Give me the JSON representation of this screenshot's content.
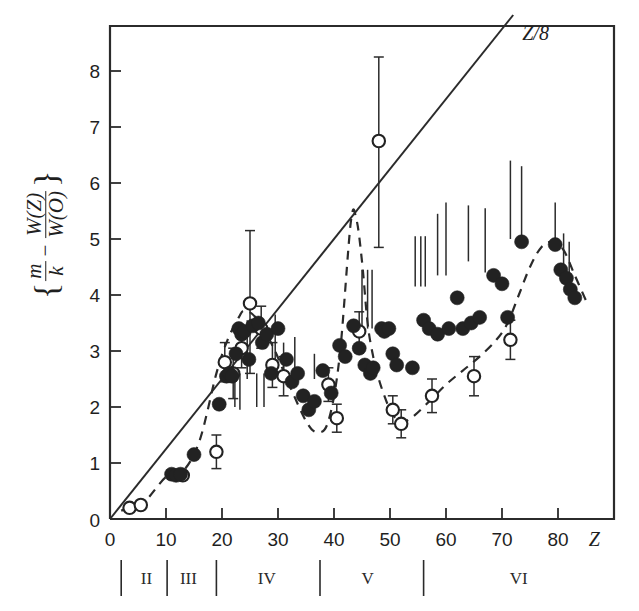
{
  "figure": {
    "title": "",
    "y_axis_label_parts": {
      "open_brace": "{",
      "frac1_num": "m",
      "frac1_den": "k",
      "minus": "−",
      "frac2_num": "W(Z)",
      "frac2_den": "W(O)",
      "close_brace": "}"
    },
    "x_axis_symbol": "Z",
    "line_label": "Z/8",
    "period_labels": [
      "II",
      "III",
      "IV",
      "V",
      "VI"
    ],
    "colors": {
      "ink": "#2b2b2b",
      "background": "#ffffff",
      "filled_marker": "#222222",
      "open_marker_fill": "#ffffff"
    }
  },
  "chart_data": {
    "type": "scatter",
    "title": "",
    "xlabel": "Z",
    "ylabel": "{m/k - W(Z)/W(O)}",
    "xlim": [
      0,
      90
    ],
    "ylim": [
      0,
      8.8
    ],
    "xticks": [
      0,
      10,
      20,
      30,
      40,
      50,
      60,
      70,
      80
    ],
    "yticks": [
      0,
      1,
      2,
      3,
      4,
      5,
      6,
      7,
      8
    ],
    "grid": false,
    "legend": "none",
    "annotations": [
      {
        "text": "Z/8",
        "x": 76,
        "y": 8.55,
        "note": "label for straight reference line"
      }
    ],
    "reference_line": {
      "name": "Z/8",
      "type": "line",
      "formula": "y = Z/8",
      "x": [
        0,
        72
      ],
      "y": [
        0,
        9.0
      ]
    },
    "dashed_curve": {
      "name": "fitted periodic trend",
      "style": "dashed",
      "x": [
        2,
        6,
        10,
        13,
        16,
        19,
        21,
        23,
        24,
        26,
        29,
        32,
        35,
        37,
        39,
        41,
        43,
        44,
        45,
        46,
        47,
        48,
        49,
        50,
        51,
        52,
        54,
        57,
        60,
        63,
        66,
        69,
        71,
        73,
        75,
        77,
        79,
        81,
        83,
        85
      ],
      "y": [
        0.15,
        0.3,
        0.75,
        0.85,
        1.4,
        2.6,
        3.2,
        3.6,
        3.72,
        3.6,
        3.1,
        2.4,
        1.75,
        1.55,
        1.75,
        2.9,
        5.3,
        5.35,
        4.6,
        3.5,
        2.9,
        2.5,
        2.2,
        1.95,
        1.8,
        1.72,
        1.82,
        2.1,
        2.4,
        2.65,
        2.9,
        3.2,
        3.5,
        4.0,
        4.5,
        4.85,
        4.95,
        4.8,
        4.35,
        3.9
      ]
    },
    "series": [
      {
        "name": "open circles",
        "marker": "open-circle",
        "points": [
          {
            "x": 3.5,
            "y": 0.2
          },
          {
            "x": 5.5,
            "y": 0.25
          },
          {
            "x": 13.0,
            "y": 0.78
          },
          {
            "x": 19.0,
            "y": 1.2,
            "yerr_low": 0.9,
            "yerr_high": 1.5
          },
          {
            "x": 20.5,
            "y": 2.8,
            "yerr_low": 2.45,
            "yerr_high": 3.15
          },
          {
            "x": 22.0,
            "y": 2.6,
            "yerr_low": 2.15,
            "yerr_high": 3.05
          },
          {
            "x": 23.5,
            "y": 3.05,
            "yerr_low": 2.7,
            "yerr_high": 3.45
          },
          {
            "x": 25.0,
            "y": 3.85,
            "yerr_low": 2.6,
            "yerr_high": 5.15
          },
          {
            "x": 27.0,
            "y": 3.4,
            "yerr_low": 3.05,
            "yerr_high": 3.8
          },
          {
            "x": 29.0,
            "y": 2.75,
            "yerr_low": 2.35,
            "yerr_high": 3.15
          },
          {
            "x": 31.0,
            "y": 2.55,
            "yerr_low": 2.2,
            "yerr_high": 2.9
          },
          {
            "x": 39.0,
            "y": 2.4,
            "yerr_low": 2.1,
            "yerr_high": 2.7
          },
          {
            "x": 40.5,
            "y": 1.8,
            "yerr_low": 1.55,
            "yerr_high": 2.05
          },
          {
            "x": 44.5,
            "y": 3.35,
            "yerr_low": 3.0,
            "yerr_high": 3.7
          },
          {
            "x": 48.0,
            "y": 6.75,
            "yerr_low": 4.85,
            "yerr_high": 8.25
          },
          {
            "x": 50.5,
            "y": 1.95,
            "yerr_low": 1.7,
            "yerr_high": 2.2
          },
          {
            "x": 52.0,
            "y": 1.7,
            "yerr_low": 1.45,
            "yerr_high": 1.95
          },
          {
            "x": 57.5,
            "y": 2.2,
            "yerr_low": 1.9,
            "yerr_high": 2.5
          },
          {
            "x": 65.0,
            "y": 2.55,
            "yerr_low": 2.2,
            "yerr_high": 2.9
          },
          {
            "x": 71.5,
            "y": 3.2,
            "yerr_low": 2.85,
            "yerr_high": 3.55
          }
        ]
      },
      {
        "name": "filled circles",
        "marker": "filled-circle",
        "points": [
          {
            "x": 11.0,
            "y": 0.8
          },
          {
            "x": 11.8,
            "y": 0.78
          },
          {
            "x": 12.6,
            "y": 0.8
          },
          {
            "x": 15.0,
            "y": 1.15
          },
          {
            "x": 19.5,
            "y": 2.05
          },
          {
            "x": 20.8,
            "y": 2.55
          },
          {
            "x": 21.3,
            "y": 2.6
          },
          {
            "x": 21.8,
            "y": 2.55
          },
          {
            "x": 22.5,
            "y": 2.95
          },
          {
            "x": 23.0,
            "y": 3.4
          },
          {
            "x": 23.5,
            "y": 3.3
          },
          {
            "x": 24.0,
            "y": 3.35
          },
          {
            "x": 24.8,
            "y": 2.85
          },
          {
            "x": 25.5,
            "y": 3.45
          },
          {
            "x": 26.5,
            "y": 3.5
          },
          {
            "x": 27.2,
            "y": 3.15
          },
          {
            "x": 28.0,
            "y": 3.3
          },
          {
            "x": 28.8,
            "y": 2.6
          },
          {
            "x": 30.0,
            "y": 3.4
          },
          {
            "x": 31.5,
            "y": 2.85
          },
          {
            "x": 32.5,
            "y": 2.45
          },
          {
            "x": 33.5,
            "y": 2.6
          },
          {
            "x": 34.5,
            "y": 2.2
          },
          {
            "x": 35.5,
            "y": 1.95
          },
          {
            "x": 36.5,
            "y": 2.1
          },
          {
            "x": 38.0,
            "y": 2.65
          },
          {
            "x": 39.5,
            "y": 2.25
          },
          {
            "x": 41.0,
            "y": 3.1
          },
          {
            "x": 42.0,
            "y": 2.9
          },
          {
            "x": 43.5,
            "y": 3.45
          },
          {
            "x": 44.5,
            "y": 3.05
          },
          {
            "x": 45.5,
            "y": 2.75
          },
          {
            "x": 46.5,
            "y": 2.6
          },
          {
            "x": 47.0,
            "y": 2.7
          },
          {
            "x": 48.5,
            "y": 3.4
          },
          {
            "x": 49.0,
            "y": 3.35
          },
          {
            "x": 49.8,
            "y": 3.4
          },
          {
            "x": 50.5,
            "y": 2.95
          },
          {
            "x": 51.2,
            "y": 2.75
          },
          {
            "x": 54.0,
            "y": 2.7
          },
          {
            "x": 56.0,
            "y": 3.55
          },
          {
            "x": 57.0,
            "y": 3.4
          },
          {
            "x": 58.5,
            "y": 3.3
          },
          {
            "x": 60.5,
            "y": 3.4
          },
          {
            "x": 62.0,
            "y": 3.95
          },
          {
            "x": 63.0,
            "y": 3.4
          },
          {
            "x": 64.5,
            "y": 3.5
          },
          {
            "x": 66.0,
            "y": 3.6
          },
          {
            "x": 68.5,
            "y": 4.35
          },
          {
            "x": 70.0,
            "y": 4.2
          },
          {
            "x": 71.0,
            "y": 3.6
          },
          {
            "x": 73.5,
            "y": 4.95
          },
          {
            "x": 79.5,
            "y": 4.9
          },
          {
            "x": 80.5,
            "y": 4.45
          },
          {
            "x": 81.5,
            "y": 4.3
          },
          {
            "x": 82.2,
            "y": 4.1
          },
          {
            "x": 83.0,
            "y": 3.95
          }
        ]
      }
    ],
    "bare_error_bars": [
      {
        "x": 22.3,
        "ylow": 2.0,
        "yhigh": 2.6
      },
      {
        "x": 23.2,
        "ylow": 1.95,
        "yhigh": 2.6
      },
      {
        "x": 24.5,
        "ylow": 2.5,
        "yhigh": 3.55
      },
      {
        "x": 26.2,
        "ylow": 2.0,
        "yhigh": 2.6
      },
      {
        "x": 27.5,
        "ylow": 2.0,
        "yhigh": 2.6
      },
      {
        "x": 29.5,
        "ylow": 2.8,
        "yhigh": 3.65
      },
      {
        "x": 31.0,
        "ylow": 2.45,
        "yhigh": 3.15
      },
      {
        "x": 33.0,
        "ylow": 2.6,
        "yhigh": 3.25
      },
      {
        "x": 36.5,
        "ylow": 2.5,
        "yhigh": 2.95
      },
      {
        "x": 45.0,
        "ylow": 3.4,
        "yhigh": 4.45
      },
      {
        "x": 46.0,
        "ylow": 3.4,
        "yhigh": 4.45
      },
      {
        "x": 46.8,
        "ylow": 3.4,
        "yhigh": 4.45
      },
      {
        "x": 54.5,
        "ylow": 4.15,
        "yhigh": 5.05
      },
      {
        "x": 55.5,
        "ylow": 4.15,
        "yhigh": 5.05
      },
      {
        "x": 56.3,
        "ylow": 4.15,
        "yhigh": 5.05
      },
      {
        "x": 58.5,
        "ylow": 4.35,
        "yhigh": 5.45
      },
      {
        "x": 60.0,
        "ylow": 4.35,
        "yhigh": 5.65
      },
      {
        "x": 64.0,
        "ylow": 4.6,
        "yhigh": 5.6
      },
      {
        "x": 67.0,
        "ylow": 4.4,
        "yhigh": 5.55
      },
      {
        "x": 71.5,
        "ylow": 5.0,
        "yhigh": 6.4
      },
      {
        "x": 73.5,
        "ylow": 5.0,
        "yhigh": 6.3
      },
      {
        "x": 79.5,
        "ylow": 4.9,
        "yhigh": 5.65
      },
      {
        "x": 81.0,
        "ylow": 4.35,
        "yhigh": 5.1
      },
      {
        "x": 82.0,
        "ylow": 4.2,
        "yhigh": 4.95
      }
    ],
    "period_bands": [
      {
        "label": "II",
        "sep_at_z": 2.0,
        "center_z": 6.5
      },
      {
        "label": "III",
        "sep_at_z": 10.2,
        "center_z": 14.0
      },
      {
        "label": "IV",
        "sep_at_z": 19.0,
        "center_z": 28.0
      },
      {
        "label": "V",
        "sep_at_z": 37.5,
        "center_z": 46.0
      },
      {
        "label": "VI",
        "sep_at_z": 56.0,
        "center_z": 73.0
      }
    ]
  }
}
